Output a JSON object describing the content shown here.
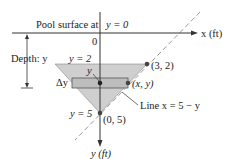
{
  "labels": {
    "surface": "Pool surface at",
    "surface_eq": "y = 0",
    "x_axis": "x (ft)",
    "y_axis": "y (ft)",
    "origin": "0",
    "depth": "Depth: y",
    "y2": "y = 2",
    "y5": "y = 5",
    "y_strip": "y",
    "delta_y": "Δy",
    "pt_32": "(3, 2)",
    "pt_xy": "(x, y)",
    "pt_05": "(0, 5)",
    "line_eq": "Line x = 5 − y"
  },
  "colors": {
    "fill": "#cfcfcf",
    "strip": "#bdbdbd",
    "line": "#333333",
    "dash": "#999999"
  }
}
